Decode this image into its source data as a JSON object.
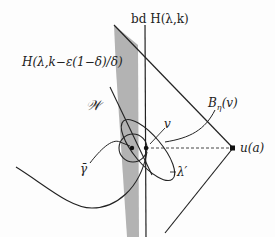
{
  "diagram": {
    "labels": {
      "boundary": "bd H(λ,k)",
      "halfspace": "H(λ,k−ε(1−δ)/δ)",
      "set_w": "𝒲",
      "ball": "Bη(v)",
      "ball_main": "B",
      "ball_sub": "η",
      "ball_arg": "(v)",
      "point_v": "v",
      "point_u": "u(a)",
      "lambda_prime": "λ′",
      "gamma_bar": "γ̄"
    },
    "colors": {
      "stroke": "#222222",
      "band": "#b3b3b3",
      "background": "#fdfdfd"
    }
  }
}
